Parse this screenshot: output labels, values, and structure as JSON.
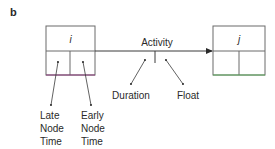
{
  "panel_label": "b",
  "nodes": [
    {
      "id": "i",
      "label": "i"
    },
    {
      "id": "j",
      "label": "j"
    }
  ],
  "activity": {
    "label": "Activity",
    "annotations": {
      "left": "Duration",
      "right": "Float"
    }
  },
  "node_annotations": {
    "left_lines": [
      "Late",
      "Node",
      "Time"
    ],
    "right_lines": [
      "Early",
      "Node",
      "Time"
    ]
  },
  "colors": {
    "line": "#3a3a3a",
    "node_i_bottom": "#8a3a7a",
    "node_j_bottom": "#5aa85a",
    "box": "#6a6a6a"
  }
}
